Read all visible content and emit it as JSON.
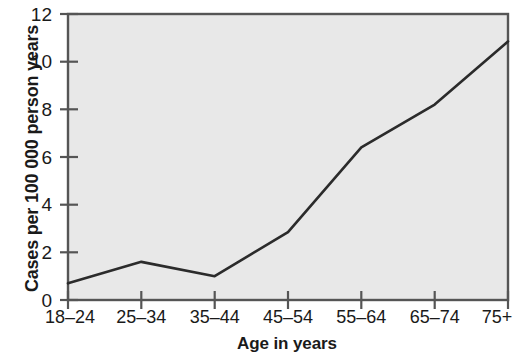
{
  "chart_data": {
    "type": "line",
    "title": "",
    "xlabel": "Age in years",
    "ylabel": "Cases per 100 000 person years",
    "categories": [
      "18–24",
      "25–34",
      "35–44",
      "45–54",
      "55–64",
      "65–74",
      "75+"
    ],
    "values": [
      0.7,
      1.6,
      1.0,
      2.85,
      6.4,
      8.2,
      10.85
    ],
    "series": [
      {
        "name": "Cases per 100 000 person years",
        "values": [
          0.7,
          1.6,
          1.0,
          2.85,
          6.4,
          8.2,
          10.85
        ]
      }
    ],
    "ylim": [
      0,
      12
    ],
    "yticks": [
      0,
      2,
      4,
      6,
      8,
      10,
      12
    ],
    "ytick_labels": [
      "0",
      "2",
      "4",
      "6",
      "8",
      "10",
      "12"
    ],
    "grid": false,
    "legend": false,
    "legend_position": "none",
    "plot_background_color": "#e8e8e8",
    "line_color": "#2b2b2b",
    "axis_color": "#555555",
    "text_color": "#1a1a1a"
  },
  "axes": {
    "y_title": "Cases per 100 000 person years",
    "x_title": "Age in years"
  }
}
